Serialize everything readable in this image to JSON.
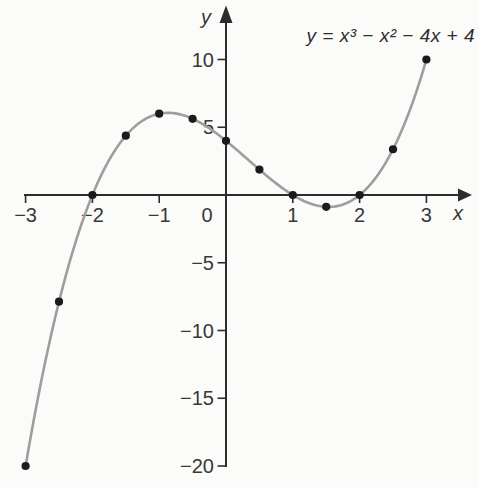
{
  "page": {
    "background": "#fbfbf9"
  },
  "chart_data": {
    "type": "line",
    "title": "",
    "equation": "y = x³ − x² − 4x + 4",
    "function": {
      "expression": "x^3 - x^2 - 4x + 4",
      "coefficients": [
        1,
        -1,
        -4,
        4
      ],
      "domain": [
        -3,
        3
      ]
    },
    "points": [
      [
        -3,
        -20
      ],
      [
        -2.5,
        -7.875
      ],
      [
        -2,
        0
      ],
      [
        -1.5,
        4.375
      ],
      [
        -1,
        6
      ],
      [
        -0.5,
        5.625
      ],
      [
        0,
        4
      ],
      [
        0.5,
        1.875
      ],
      [
        1,
        0
      ],
      [
        1.5,
        -0.875
      ],
      [
        2,
        0
      ],
      [
        2.5,
        3.375
      ],
      [
        3,
        10
      ]
    ],
    "xlabel": "x",
    "ylabel": "y",
    "xlim": [
      -3.1,
      3.7
    ],
    "ylim": [
      -20.5,
      14
    ],
    "x_ticks": [
      -3,
      -2,
      -1,
      1,
      2,
      3
    ],
    "x_tick_labels": [
      "−3",
      "−2",
      "−1",
      "1",
      "2",
      "3"
    ],
    "origin_tick_label": "0",
    "y_ticks": [
      10,
      5,
      -5,
      -10,
      -15,
      -20
    ],
    "y_tick_labels": [
      "10",
      "5",
      "−5",
      "−10",
      "−15",
      "−20"
    ],
    "grid": false,
    "legend_position": "none",
    "colors": {
      "curve": "#9e9e9e",
      "points": "#1b1b1b",
      "axes": "#2c2c2c",
      "text": "#383838"
    }
  }
}
